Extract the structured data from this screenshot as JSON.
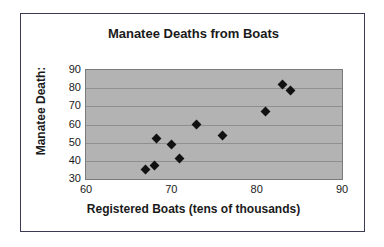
{
  "chart_data": {
    "type": "scatter",
    "title": "Manatee Deaths from Boats",
    "xlabel": "Registered Boats (tens of thousands)",
    "ylabel": "Manatee Death:",
    "ylabel_full": "Manatee Deaths",
    "xlim": [
      60,
      90
    ],
    "ylim": [
      30,
      90
    ],
    "xticks": [
      60,
      70,
      80,
      90
    ],
    "yticks": [
      30,
      40,
      50,
      60,
      70,
      80,
      90
    ],
    "grid": true,
    "grid_axis": "y",
    "legend": false,
    "plot_background": "#b3b3b3",
    "marker_color": "#111111",
    "marker_shape": "diamond",
    "points": [
      {
        "x": 67.0,
        "y": 35.0
      },
      {
        "x": 68.0,
        "y": 37.5
      },
      {
        "x": 68.2,
        "y": 52.5
      },
      {
        "x": 70.0,
        "y": 49.0
      },
      {
        "x": 71.0,
        "y": 41.5
      },
      {
        "x": 73.0,
        "y": 60.0
      },
      {
        "x": 76.0,
        "y": 54.0
      },
      {
        "x": 81.0,
        "y": 67.0
      },
      {
        "x": 83.0,
        "y": 82.0
      },
      {
        "x": 84.0,
        "y": 78.5
      }
    ]
  }
}
